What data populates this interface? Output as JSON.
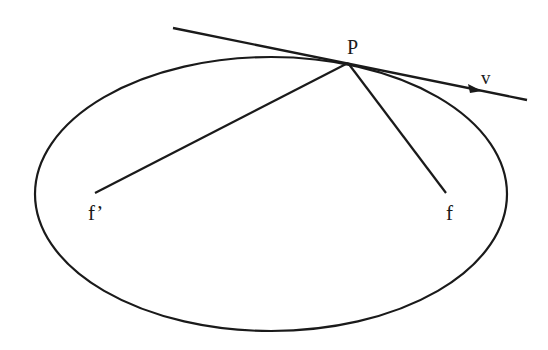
{
  "diagram": {
    "type": "ellipse-reflection",
    "stroke_color": "#1a1a1a",
    "background": "#ffffff",
    "ellipse": {
      "cx": 271,
      "cy": 194,
      "rx": 236,
      "ry": 137
    },
    "tangent_line": {
      "x1": 173,
      "y1": 28,
      "x2": 527,
      "y2": 100
    },
    "arrowhead": {
      "x": 482,
      "y": 91
    },
    "point_P": {
      "x": 348,
      "y": 63
    },
    "focus_left": {
      "x": 95,
      "y": 193
    },
    "focus_right": {
      "x": 446,
      "y": 193
    },
    "labels": {
      "P": "P",
      "v": "v",
      "f_prime": "f’",
      "f": "f"
    }
  }
}
